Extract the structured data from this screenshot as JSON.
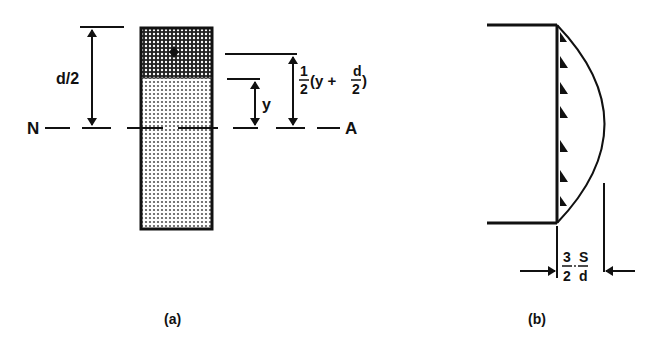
{
  "figure_a": {
    "caption": "(a)",
    "dim_left_label": "d/2",
    "dim_inner_label": "y",
    "dim_right_label": {
      "coef_num": "1",
      "coef_den": "2",
      "open": "(y +",
      "frac_num": "d",
      "frac_den": "2",
      "close": ")"
    },
    "axis_left_label": "N",
    "axis_right_label": "A"
  },
  "figure_b": {
    "caption": "(b)",
    "dim_label": {
      "frac1_num": "3",
      "frac1_den": "2",
      "frac2_num": "S",
      "frac2_den": "d"
    }
  },
  "colors": {
    "ink": "#111111",
    "light_fill": "#d6d6d6",
    "dark_fill": "#7a7a7a"
  }
}
